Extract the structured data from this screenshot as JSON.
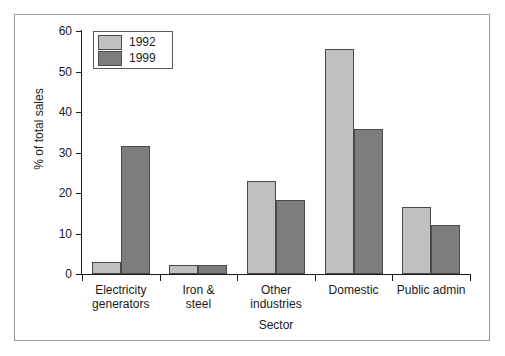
{
  "chart_data": {
    "type": "bar",
    "title": "",
    "subtitle": "",
    "xlabel": "Sector",
    "ylabel": "% of total sales",
    "categories": [
      "Electricity generators",
      "Iron & steel",
      "Other industries",
      "Domestic",
      "Public admin"
    ],
    "category_lines": [
      [
        "Electricity",
        "generators"
      ],
      [
        "Iron &",
        "steel"
      ],
      [
        "Other",
        "industries"
      ],
      [
        "Domestic",
        ""
      ],
      [
        "Public admin",
        ""
      ]
    ],
    "series": [
      {
        "name": "1992",
        "color": "#c0c0c0",
        "values": [
          3,
          2.3,
          23,
          55.5,
          16.5
        ]
      },
      {
        "name": "1999",
        "color": "#7d7d7d",
        "values": [
          31.5,
          2.2,
          18.3,
          35.8,
          12.2
        ]
      }
    ],
    "ylim": [
      0,
      60
    ],
    "yticks": [
      0,
      10,
      20,
      30,
      40,
      50,
      60
    ],
    "ytick_labels": [
      "0",
      "10",
      "20",
      "30",
      "40",
      "50",
      "60"
    ],
    "grid": false,
    "legend_position": "top-left",
    "legend_entries": [
      "1992",
      "1999"
    ]
  },
  "figure": {
    "frame_color": "#9a9a9a",
    "axis_color": "#1a1a1a",
    "background": "#ffffff"
  }
}
